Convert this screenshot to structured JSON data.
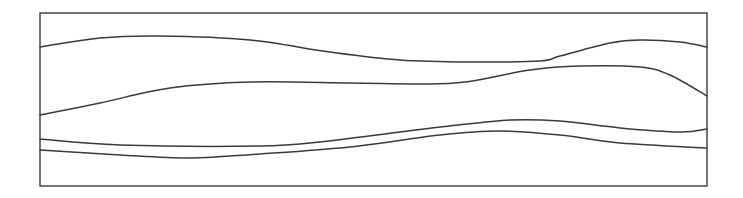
{
  "diagram": {
    "frame": {
      "x": 40,
      "y": 13,
      "width": 667,
      "height": 173,
      "stroke": "#3a3a3a"
    },
    "line_color": "#3a3a3a",
    "curves": [
      {
        "name": "curve-1",
        "points": [
          [
            40,
            47
          ],
          [
            100,
            38
          ],
          [
            160,
            36
          ],
          [
            250,
            40
          ],
          [
            330,
            52
          ],
          [
            400,
            60
          ],
          [
            470,
            62
          ],
          [
            540,
            61
          ],
          [
            560,
            56
          ],
          [
            610,
            43
          ],
          [
            640,
            40
          ],
          [
            680,
            42
          ],
          [
            707,
            47
          ]
        ]
      },
      {
        "name": "curve-2",
        "points": [
          [
            40,
            115
          ],
          [
            100,
            103
          ],
          [
            170,
            88
          ],
          [
            250,
            82
          ],
          [
            350,
            83
          ],
          [
            420,
            84
          ],
          [
            465,
            82
          ],
          [
            530,
            70
          ],
          [
            580,
            66
          ],
          [
            640,
            67
          ],
          [
            670,
            75
          ],
          [
            707,
            96
          ]
        ]
      },
      {
        "name": "curve-3",
        "points": [
          [
            40,
            139
          ],
          [
            120,
            145
          ],
          [
            260,
            146
          ],
          [
            320,
            142
          ],
          [
            400,
            132
          ],
          [
            450,
            126
          ],
          [
            510,
            120
          ],
          [
            560,
            121
          ],
          [
            620,
            128
          ],
          [
            680,
            132
          ],
          [
            707,
            129
          ]
        ]
      },
      {
        "name": "curve-4",
        "points": [
          [
            40,
            150
          ],
          [
            120,
            155
          ],
          [
            190,
            158
          ],
          [
            260,
            154
          ],
          [
            350,
            147
          ],
          [
            440,
            135
          ],
          [
            500,
            131
          ],
          [
            560,
            135
          ],
          [
            620,
            143
          ],
          [
            707,
            148
          ]
        ]
      }
    ]
  }
}
